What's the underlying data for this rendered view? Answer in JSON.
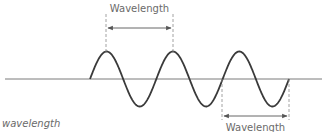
{
  "diagram": {
    "top_label": "Wavelength",
    "bottom_label": "Wavelength",
    "caption": "wavelength",
    "colors": {
      "wave": "#3a3a3a",
      "baseline": "#7a7a7a",
      "guide": "#8a8a8a",
      "text": "#6a6a6a"
    },
    "wave": {
      "cycles": 3,
      "start_x": 90,
      "end_x": 289,
      "baseline_y": 79,
      "peak_y": 52,
      "trough_y": 107,
      "peaks_x": [
        106,
        173,
        239
      ],
      "troughs_x": [
        138,
        205,
        272
      ]
    },
    "top_measure": {
      "from_x": 106,
      "to_x": 173,
      "arrow_y": 28
    },
    "bottom_measure": {
      "from_x": 222,
      "to_x": 289,
      "arrow_y": 116
    }
  }
}
